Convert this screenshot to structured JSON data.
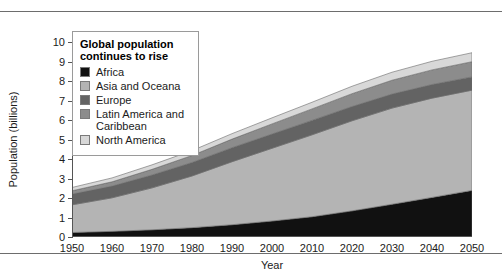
{
  "figure": {
    "rules": [
      "top-rule",
      "bottom-rule"
    ]
  },
  "legend": {
    "title_line1": "Global population",
    "title_line2": "continues to rise",
    "entries": [
      {
        "label": "Africa",
        "color": "#111111"
      },
      {
        "label": "Asia and Oceana",
        "color": "#b4b4b4"
      },
      {
        "label": "Europe",
        "color": "#636363"
      },
      {
        "label": "Latin America and",
        "label2": "Caribbean",
        "color": "#8c8c8c"
      },
      {
        "label": "North America",
        "color": "#d8d8d8"
      }
    ]
  },
  "chart_data": {
    "type": "area",
    "stacked": true,
    "title": "Global population continues to rise",
    "xlabel": "Year",
    "ylabel": "Population (billions)",
    "xlim": [
      1950,
      2050
    ],
    "ylim": [
      0,
      10
    ],
    "grid": false,
    "legend_position": "top-left-inset",
    "x": [
      1950,
      1960,
      1970,
      1980,
      1990,
      2000,
      2010,
      2020,
      2030,
      2040,
      2050
    ],
    "xticks": [
      "1950",
      "1960",
      "1970",
      "1980",
      "1990",
      "2000",
      "2010",
      "2020",
      "2030",
      "2040",
      "2050"
    ],
    "yticks": [
      "0",
      "1",
      "2",
      "3",
      "4",
      "5",
      "6",
      "7",
      "8",
      "9",
      "10"
    ],
    "series": [
      {
        "name": "Africa",
        "color": "#111111",
        "values": [
          0.23,
          0.29,
          0.37,
          0.48,
          0.63,
          0.82,
          1.04,
          1.34,
          1.68,
          2.03,
          2.39
        ]
      },
      {
        "name": "Asia and Oceana",
        "color": "#b4b4b4",
        "values": [
          1.42,
          1.72,
          2.15,
          2.65,
          3.23,
          3.73,
          4.2,
          4.62,
          4.93,
          5.09,
          5.14
        ]
      },
      {
        "name": "Europe",
        "color": "#636363",
        "values": [
          0.55,
          0.6,
          0.66,
          0.69,
          0.72,
          0.73,
          0.74,
          0.73,
          0.72,
          0.7,
          0.68
        ]
      },
      {
        "name": "Latin America and Caribbean",
        "color": "#8c8c8c",
        "values": [
          0.17,
          0.22,
          0.29,
          0.36,
          0.44,
          0.52,
          0.59,
          0.66,
          0.71,
          0.75,
          0.78
        ]
      },
      {
        "name": "North America",
        "color": "#d8d8d8",
        "values": [
          0.17,
          0.2,
          0.23,
          0.25,
          0.28,
          0.31,
          0.34,
          0.38,
          0.41,
          0.44,
          0.46
        ]
      }
    ],
    "totals": [
      2.54,
      3.03,
      3.7,
      4.43,
      5.3,
      6.11,
      6.91,
      7.73,
      8.45,
      9.01,
      9.45
    ]
  }
}
